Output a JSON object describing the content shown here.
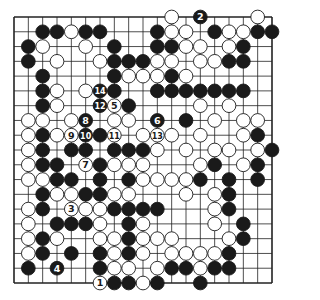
{
  "diagram": {
    "type": "go-board",
    "size": 19,
    "colors": {
      "background": "#ffffff",
      "line": "#222222",
      "black": "#1a1a1a",
      "white": "#ffffff"
    },
    "geometry": {
      "left": 14,
      "top": 17,
      "right": 272,
      "bottom": 283
    },
    "stones": [
      {
        "r": 0,
        "c": 11,
        "color": "W"
      },
      {
        "r": 0,
        "c": 13,
        "color": "B",
        "label": "2"
      },
      {
        "r": 0,
        "c": 17,
        "color": "W"
      },
      {
        "r": 1,
        "c": 2,
        "color": "B"
      },
      {
        "r": 1,
        "c": 3,
        "color": "B"
      },
      {
        "r": 1,
        "c": 4,
        "color": "W"
      },
      {
        "r": 1,
        "c": 5,
        "color": "B"
      },
      {
        "r": 1,
        "c": 6,
        "color": "B"
      },
      {
        "r": 1,
        "c": 10,
        "color": "B"
      },
      {
        "r": 1,
        "c": 11,
        "color": "W"
      },
      {
        "r": 1,
        "c": 12,
        "color": "W"
      },
      {
        "r": 1,
        "c": 14,
        "color": "B"
      },
      {
        "r": 1,
        "c": 15,
        "color": "W"
      },
      {
        "r": 1,
        "c": 16,
        "color": "W"
      },
      {
        "r": 1,
        "c": 17,
        "color": "B"
      },
      {
        "r": 1,
        "c": 18,
        "color": "B"
      },
      {
        "r": 2,
        "c": 1,
        "color": "B"
      },
      {
        "r": 2,
        "c": 2,
        "color": "W"
      },
      {
        "r": 2,
        "c": 5,
        "color": "W"
      },
      {
        "r": 2,
        "c": 7,
        "color": "B"
      },
      {
        "r": 2,
        "c": 10,
        "color": "B"
      },
      {
        "r": 2,
        "c": 11,
        "color": "B"
      },
      {
        "r": 2,
        "c": 12,
        "color": "W"
      },
      {
        "r": 2,
        "c": 13,
        "color": "W"
      },
      {
        "r": 2,
        "c": 15,
        "color": "W"
      },
      {
        "r": 2,
        "c": 16,
        "color": "B"
      },
      {
        "r": 3,
        "c": 1,
        "color": "B"
      },
      {
        "r": 3,
        "c": 3,
        "color": "W"
      },
      {
        "r": 3,
        "c": 6,
        "color": "W"
      },
      {
        "r": 3,
        "c": 7,
        "color": "B"
      },
      {
        "r": 3,
        "c": 8,
        "color": "B"
      },
      {
        "r": 3,
        "c": 9,
        "color": "B"
      },
      {
        "r": 3,
        "c": 10,
        "color": "W"
      },
      {
        "r": 3,
        "c": 11,
        "color": "W"
      },
      {
        "r": 3,
        "c": 13,
        "color": "W"
      },
      {
        "r": 3,
        "c": 14,
        "color": "W"
      },
      {
        "r": 3,
        "c": 15,
        "color": "B"
      },
      {
        "r": 3,
        "c": 16,
        "color": "B"
      },
      {
        "r": 4,
        "c": 2,
        "color": "B"
      },
      {
        "r": 4,
        "c": 7,
        "color": "B"
      },
      {
        "r": 4,
        "c": 8,
        "color": "W"
      },
      {
        "r": 4,
        "c": 9,
        "color": "W"
      },
      {
        "r": 4,
        "c": 10,
        "color": "W"
      },
      {
        "r": 4,
        "c": 11,
        "color": "B"
      },
      {
        "r": 4,
        "c": 12,
        "color": "W"
      },
      {
        "r": 5,
        "c": 2,
        "color": "B"
      },
      {
        "r": 5,
        "c": 3,
        "color": "W"
      },
      {
        "r": 5,
        "c": 5,
        "color": "W"
      },
      {
        "r": 5,
        "c": 6,
        "color": "B",
        "label": "14"
      },
      {
        "r": 5,
        "c": 7,
        "color": "B"
      },
      {
        "r": 5,
        "c": 10,
        "color": "B"
      },
      {
        "r": 5,
        "c": 11,
        "color": "B"
      },
      {
        "r": 5,
        "c": 12,
        "color": "B"
      },
      {
        "r": 5,
        "c": 13,
        "color": "B"
      },
      {
        "r": 5,
        "c": 14,
        "color": "B"
      },
      {
        "r": 5,
        "c": 15,
        "color": "B"
      },
      {
        "r": 5,
        "c": 16,
        "color": "B"
      },
      {
        "r": 6,
        "c": 2,
        "color": "B"
      },
      {
        "r": 6,
        "c": 3,
        "color": "W"
      },
      {
        "r": 6,
        "c": 6,
        "color": "B",
        "label": "12"
      },
      {
        "r": 6,
        "c": 7,
        "color": "W",
        "label": "5"
      },
      {
        "r": 6,
        "c": 8,
        "color": "B"
      },
      {
        "r": 6,
        "c": 13,
        "color": "W"
      },
      {
        "r": 6,
        "c": 15,
        "color": "W"
      },
      {
        "r": 7,
        "c": 1,
        "color": "W"
      },
      {
        "r": 7,
        "c": 2,
        "color": "W"
      },
      {
        "r": 7,
        "c": 4,
        "color": "W"
      },
      {
        "r": 7,
        "c": 5,
        "color": "B",
        "label": "8"
      },
      {
        "r": 7,
        "c": 7,
        "color": "W"
      },
      {
        "r": 7,
        "c": 8,
        "color": "W"
      },
      {
        "r": 7,
        "c": 10,
        "color": "B",
        "label": "6"
      },
      {
        "r": 7,
        "c": 12,
        "color": "B"
      },
      {
        "r": 7,
        "c": 14,
        "color": "W"
      },
      {
        "r": 7,
        "c": 16,
        "color": "W"
      },
      {
        "r": 7,
        "c": 17,
        "color": "W"
      },
      {
        "r": 8,
        "c": 1,
        "color": "W"
      },
      {
        "r": 8,
        "c": 2,
        "color": "B"
      },
      {
        "r": 8,
        "c": 3,
        "color": "W"
      },
      {
        "r": 8,
        "c": 4,
        "color": "W",
        "label": "9"
      },
      {
        "r": 8,
        "c": 5,
        "color": "B",
        "label": "10"
      },
      {
        "r": 8,
        "c": 6,
        "color": "B"
      },
      {
        "r": 8,
        "c": 7,
        "color": "W",
        "label": "11"
      },
      {
        "r": 8,
        "c": 9,
        "color": "W"
      },
      {
        "r": 8,
        "c": 10,
        "color": "W",
        "label": "13"
      },
      {
        "r": 8,
        "c": 11,
        "color": "W"
      },
      {
        "r": 8,
        "c": 13,
        "color": "W"
      },
      {
        "r": 8,
        "c": 16,
        "color": "W"
      },
      {
        "r": 8,
        "c": 17,
        "color": "B"
      },
      {
        "r": 9,
        "c": 1,
        "color": "W"
      },
      {
        "r": 9,
        "c": 2,
        "color": "B"
      },
      {
        "r": 9,
        "c": 4,
        "color": "B"
      },
      {
        "r": 9,
        "c": 5,
        "color": "B"
      },
      {
        "r": 9,
        "c": 7,
        "color": "B"
      },
      {
        "r": 9,
        "c": 8,
        "color": "B"
      },
      {
        "r": 9,
        "c": 9,
        "color": "B"
      },
      {
        "r": 9,
        "c": 10,
        "color": "W"
      },
      {
        "r": 9,
        "c": 12,
        "color": "W"
      },
      {
        "r": 9,
        "c": 14,
        "color": "W"
      },
      {
        "r": 9,
        "c": 15,
        "color": "W"
      },
      {
        "r": 9,
        "c": 17,
        "color": "W"
      },
      {
        "r": 9,
        "c": 18,
        "color": "B"
      },
      {
        "r": 10,
        "c": 1,
        "color": "W"
      },
      {
        "r": 10,
        "c": 2,
        "color": "B"
      },
      {
        "r": 10,
        "c": 3,
        "color": "B"
      },
      {
        "r": 10,
        "c": 5,
        "color": "W",
        "label": "7"
      },
      {
        "r": 10,
        "c": 6,
        "color": "B"
      },
      {
        "r": 10,
        "c": 7,
        "color": "W"
      },
      {
        "r": 10,
        "c": 8,
        "color": "W"
      },
      {
        "r": 10,
        "c": 9,
        "color": "W"
      },
      {
        "r": 10,
        "c": 13,
        "color": "W"
      },
      {
        "r": 10,
        "c": 14,
        "color": "B"
      },
      {
        "r": 10,
        "c": 16,
        "color": "W"
      },
      {
        "r": 10,
        "c": 17,
        "color": "B"
      },
      {
        "r": 11,
        "c": 1,
        "color": "W"
      },
      {
        "r": 11,
        "c": 2,
        "color": "W"
      },
      {
        "r": 11,
        "c": 3,
        "color": "B"
      },
      {
        "r": 11,
        "c": 4,
        "color": "B"
      },
      {
        "r": 11,
        "c": 6,
        "color": "B"
      },
      {
        "r": 11,
        "c": 8,
        "color": "B"
      },
      {
        "r": 11,
        "c": 9,
        "color": "W"
      },
      {
        "r": 11,
        "c": 10,
        "color": "W"
      },
      {
        "r": 11,
        "c": 11,
        "color": "W"
      },
      {
        "r": 11,
        "c": 12,
        "color": "W"
      },
      {
        "r": 11,
        "c": 13,
        "color": "B"
      },
      {
        "r": 11,
        "c": 15,
        "color": "B"
      },
      {
        "r": 11,
        "c": 17,
        "color": "B"
      },
      {
        "r": 12,
        "c": 2,
        "color": "B"
      },
      {
        "r": 12,
        "c": 3,
        "color": "W"
      },
      {
        "r": 12,
        "c": 4,
        "color": "W"
      },
      {
        "r": 12,
        "c": 5,
        "color": "B"
      },
      {
        "r": 12,
        "c": 6,
        "color": "B"
      },
      {
        "r": 12,
        "c": 7,
        "color": "W"
      },
      {
        "r": 12,
        "c": 8,
        "color": "W"
      },
      {
        "r": 12,
        "c": 12,
        "color": "W"
      },
      {
        "r": 12,
        "c": 14,
        "color": "W"
      },
      {
        "r": 12,
        "c": 15,
        "color": "B"
      },
      {
        "r": 13,
        "c": 1,
        "color": "W"
      },
      {
        "r": 13,
        "c": 2,
        "color": "B"
      },
      {
        "r": 13,
        "c": 4,
        "color": "W",
        "label": "3"
      },
      {
        "r": 13,
        "c": 5,
        "color": "W"
      },
      {
        "r": 13,
        "c": 6,
        "color": "W"
      },
      {
        "r": 13,
        "c": 7,
        "color": "B"
      },
      {
        "r": 13,
        "c": 8,
        "color": "B"
      },
      {
        "r": 13,
        "c": 9,
        "color": "B"
      },
      {
        "r": 13,
        "c": 10,
        "color": "B"
      },
      {
        "r": 13,
        "c": 14,
        "color": "W"
      },
      {
        "r": 13,
        "c": 15,
        "color": "B"
      },
      {
        "r": 14,
        "c": 1,
        "color": "W"
      },
      {
        "r": 14,
        "c": 3,
        "color": "B"
      },
      {
        "r": 14,
        "c": 4,
        "color": "B"
      },
      {
        "r": 14,
        "c": 5,
        "color": "B"
      },
      {
        "r": 14,
        "c": 6,
        "color": "W"
      },
      {
        "r": 14,
        "c": 8,
        "color": "B"
      },
      {
        "r": 14,
        "c": 9,
        "color": "W"
      },
      {
        "r": 14,
        "c": 14,
        "color": "W"
      },
      {
        "r": 14,
        "c": 16,
        "color": "B"
      },
      {
        "r": 15,
        "c": 1,
        "color": "W"
      },
      {
        "r": 15,
        "c": 2,
        "color": "B"
      },
      {
        "r": 15,
        "c": 3,
        "color": "W"
      },
      {
        "r": 15,
        "c": 6,
        "color": "W"
      },
      {
        "r": 15,
        "c": 7,
        "color": "W"
      },
      {
        "r": 15,
        "c": 8,
        "color": "B"
      },
      {
        "r": 15,
        "c": 9,
        "color": "W"
      },
      {
        "r": 15,
        "c": 10,
        "color": "W"
      },
      {
        "r": 15,
        "c": 11,
        "color": "W"
      },
      {
        "r": 15,
        "c": 15,
        "color": "W"
      },
      {
        "r": 15,
        "c": 16,
        "color": "B"
      },
      {
        "r": 16,
        "c": 1,
        "color": "W"
      },
      {
        "r": 16,
        "c": 2,
        "color": "B"
      },
      {
        "r": 16,
        "c": 4,
        "color": "B"
      },
      {
        "r": 16,
        "c": 6,
        "color": "B"
      },
      {
        "r": 16,
        "c": 7,
        "color": "W"
      },
      {
        "r": 16,
        "c": 8,
        "color": "B"
      },
      {
        "r": 16,
        "c": 9,
        "color": "W"
      },
      {
        "r": 16,
        "c": 11,
        "color": "W"
      },
      {
        "r": 16,
        "c": 12,
        "color": "W"
      },
      {
        "r": 16,
        "c": 13,
        "color": "W"
      },
      {
        "r": 16,
        "c": 14,
        "color": "W"
      },
      {
        "r": 16,
        "c": 15,
        "color": "B"
      },
      {
        "r": 17,
        "c": 1,
        "color": "B"
      },
      {
        "r": 17,
        "c": 3,
        "color": "B",
        "label": "4"
      },
      {
        "r": 17,
        "c": 6,
        "color": "B"
      },
      {
        "r": 17,
        "c": 7,
        "color": "W"
      },
      {
        "r": 17,
        "c": 8,
        "color": "W"
      },
      {
        "r": 17,
        "c": 10,
        "color": "W"
      },
      {
        "r": 17,
        "c": 11,
        "color": "B"
      },
      {
        "r": 17,
        "c": 12,
        "color": "B"
      },
      {
        "r": 17,
        "c": 13,
        "color": "W"
      },
      {
        "r": 17,
        "c": 14,
        "color": "B"
      },
      {
        "r": 17,
        "c": 15,
        "color": "B"
      },
      {
        "r": 18,
        "c": 6,
        "color": "W",
        "label": "1"
      },
      {
        "r": 18,
        "c": 7,
        "color": "B"
      },
      {
        "r": 18,
        "c": 8,
        "color": "B"
      },
      {
        "r": 18,
        "c": 9,
        "color": "W"
      },
      {
        "r": 18,
        "c": 10,
        "color": "B"
      },
      {
        "r": 18,
        "c": 13,
        "color": "B"
      }
    ]
  }
}
